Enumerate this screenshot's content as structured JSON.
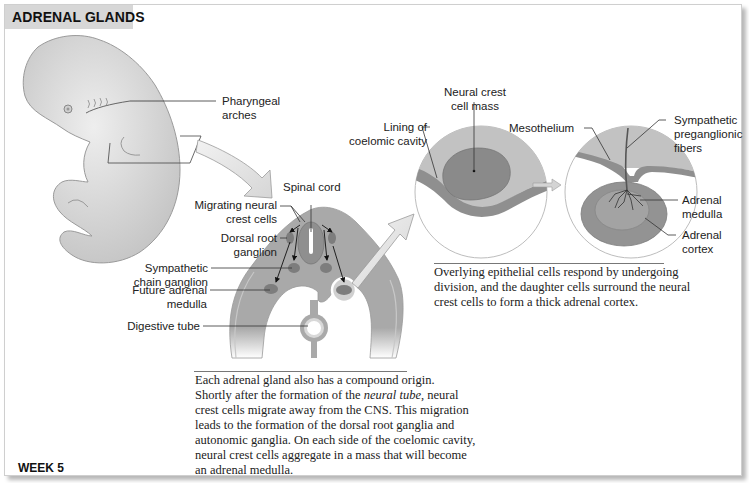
{
  "title": "ADRENAL GLANDS",
  "week": "WEEK 5",
  "labels": {
    "pharyngeal_arches": [
      "Pharyngeal",
      "arches"
    ],
    "spinal_cord": "Spinal cord",
    "migrating_neural_crest": [
      "Migrating neural",
      "crest cells"
    ],
    "dorsal_root_ganglion": [
      "Dorsal root",
      "ganglion"
    ],
    "sympathetic_chain_ganglion": [
      "Sympathetic",
      "chain ganglion"
    ],
    "future_adrenal_medulla": [
      "Future adrenal",
      "medulla"
    ],
    "digestive_tube": "Digestive tube",
    "neural_crest_cell_mass": [
      "Neural crest",
      "cell mass"
    ],
    "lining_coelomic_cavity": [
      "Lining of",
      "coelomic cavity"
    ],
    "mesothelium": "Mesothelium",
    "sympathetic_preganglionic": [
      "Sympathetic",
      "preganglionic",
      "fibers"
    ],
    "adrenal_medulla": [
      "Adrenal",
      "medulla"
    ],
    "adrenal_cortex": [
      "Adrenal",
      "cortex"
    ]
  },
  "captions": {
    "right": [
      "Overlying epithelial cells respond by undergoing",
      "division, and the daughter cells surround the neural",
      "crest cells to form a thick adrenal cortex."
    ],
    "bottom": {
      "line1": "Each adrenal gland also has a compound origin.",
      "line2_pre": "Shortly after the formation of the ",
      "line2_em": "neural tube",
      "line2_post": ", neural",
      "line3": "crest cells migrate away from the CNS. This migration",
      "line4": "leads to the formation of the dorsal root ganglia and",
      "line5": "autonomic ganglia. On each side of the coelomic cavity,",
      "line6": "neural crest cells aggregate in a mass that will become",
      "line7": "an adrenal medulla."
    }
  },
  "colors": {
    "embryo": "#d9d9d9",
    "tissue": "#a9a9a9",
    "tissue_dark": "#8a8a8a",
    "ganglion": "#7d7d7d",
    "arrow_fill": "#e6e6e6",
    "title_bg": "#d7d7d7"
  }
}
